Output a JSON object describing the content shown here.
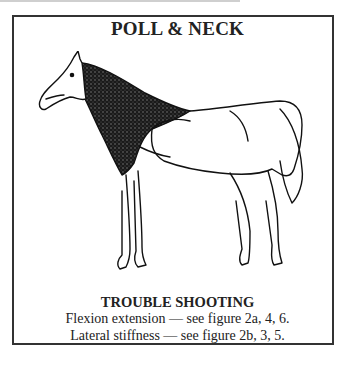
{
  "title": "POLL & NECK",
  "illustration": {
    "subject": "horse-anatomy-neck-highlighted"
  },
  "trouble_shooting": {
    "heading": "TROUBLE SHOOTING",
    "lines": [
      {
        "label": "Flexion extension —",
        "ref": "see figure 2a, 4, 6."
      },
      {
        "label": "Lateral stiffness —",
        "ref": "see figure 2b, 3, 5."
      }
    ]
  }
}
